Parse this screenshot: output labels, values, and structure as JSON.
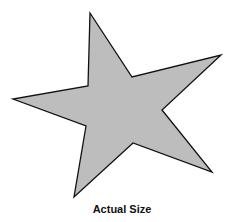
{
  "figure": {
    "shape": "star-icon",
    "fill_color": "#bdbdbd",
    "stroke_color": "#111111",
    "points": "90,13 132,77 221,55 162,110 212,172 133,143 74,197 86,126 13,99 88,86",
    "caption": "Actual Size"
  }
}
